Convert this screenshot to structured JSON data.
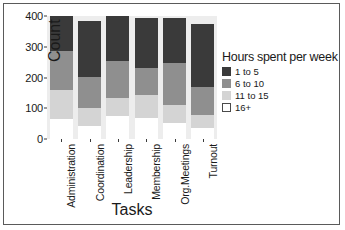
{
  "chart_data": {
    "type": "bar",
    "stacked": true,
    "title": "",
    "xlabel": "Tasks",
    "ylabel": "Count",
    "ylim": [
      0,
      400
    ],
    "yticks": [
      0,
      100,
      200,
      300,
      400
    ],
    "grid": false,
    "legend_position": "right",
    "legend_title": "Hours spent per week",
    "categories": [
      "Administration",
      "Coordination",
      "Leadership",
      "Membership",
      "Org.Meetings",
      "Turnout"
    ],
    "series": [
      {
        "name": "1 to 5",
        "color": "#3a3a3a",
        "values": [
          113,
          182,
          147,
          164,
          147,
          205
        ]
      },
      {
        "name": "6 to 10",
        "color": "#8f8f8f",
        "values": [
          127,
          103,
          120,
          89,
          134,
          92
        ]
      },
      {
        "name": "11 to 15",
        "color": "#d4d4d4",
        "values": [
          96,
          58,
          58,
          75,
          61,
          41
        ]
      },
      {
        "name": "16+",
        "color": "#ffffff",
        "values": [
          64,
          42,
          75,
          67,
          51,
          37
        ]
      }
    ],
    "totals": [
      400,
      385,
      400,
      395,
      393,
      375
    ]
  }
}
